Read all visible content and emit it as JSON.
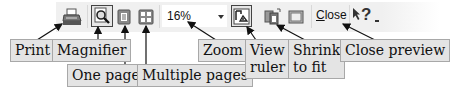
{
  "toolbar": {
    "buttons": [
      {
        "id": "print",
        "icon": "printer-icon"
      },
      {
        "id": "magnifier",
        "icon": "magnifier-icon",
        "pressed": true
      },
      {
        "id": "one_page",
        "icon": "one-page-icon"
      },
      {
        "id": "multiple_pages",
        "icon": "multiple-pages-icon"
      },
      {
        "id": "view_ruler",
        "icon": "ruler-icon",
        "pressed": true
      },
      {
        "id": "shrink_to_fit",
        "icon": "shrink-to-fit-icon"
      },
      {
        "id": "full_screen",
        "icon": "full-screen-icon"
      },
      {
        "id": "help",
        "icon": "whats-this-help-icon"
      }
    ],
    "zoom_value": "16%",
    "close_label_underlined": "C",
    "close_label_rest": "lose",
    "help_label": "?"
  },
  "callouts": {
    "print": "Print",
    "magnifier": "Magnifier",
    "one_page": "One page",
    "multiple_pages": "Multiple pages",
    "zoom": "Zoom",
    "view_ruler_line1": "View",
    "view_ruler_line2": "ruler",
    "shrink_line1": "Shrink",
    "shrink_line2": "to fit",
    "close_preview": "Close preview"
  },
  "colors": {
    "toolbar_bg": "#f0f0f0",
    "callout_bg": "#e4e4e4",
    "callout_border": "#a8a8a8",
    "arrow": "#111111"
  }
}
